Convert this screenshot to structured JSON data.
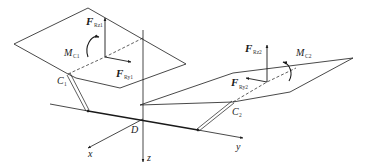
{
  "diagram": {
    "type": "mechanics free-body diagram (3D)",
    "axes": {
      "origin_label": "D",
      "x_label": "x",
      "y_label": "y",
      "z_label": "z"
    },
    "left_plane": {
      "contact_point": {
        "main": "C",
        "sub": "1"
      },
      "force_z": {
        "main": "F",
        "sub": "Rz1"
      },
      "force_y": {
        "main": "F",
        "sub": "Ry1"
      },
      "moment": {
        "main": "M",
        "sub": "C1"
      }
    },
    "right_plane": {
      "contact_point": {
        "main": "C",
        "sub": "2"
      },
      "force_z": {
        "main": "F",
        "sub": "Rz2"
      },
      "force_y": {
        "main": "F",
        "sub": "Ry2"
      },
      "moment": {
        "main": "M",
        "sub": "C2"
      }
    },
    "colors": {
      "line": "#1a1a1a",
      "background": "#ffffff"
    }
  }
}
